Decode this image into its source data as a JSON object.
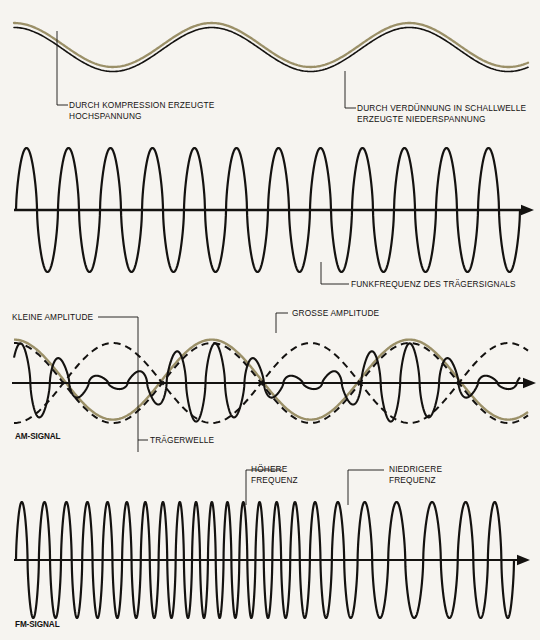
{
  "figure": {
    "background_color": "#f6f4f0",
    "ink_color": "#141210",
    "envelope_color": "#9b9068"
  },
  "panels": [
    {
      "id": "sound-wave",
      "labels": {
        "compression": "DURCH KOMPRESSION ERZEUGTE\nHOCHSPANNUNG",
        "rarefaction": "DURCH VERDÜNNUNG IN SCHALLWELLE\nERZEUGTE NIEDERSPANNUNG"
      }
    },
    {
      "id": "carrier-wave",
      "labels": {
        "carrier": "FUNKFREQUENZ DES TRÄGERSIGNALS"
      }
    },
    {
      "id": "am-signal",
      "labels": {
        "small_amplitude": "KLEINE AMPLITUDE",
        "large_amplitude": "GROSSE AMPLITUDE",
        "carrier_wave": "TRÄGERWELLE",
        "signal_name": "AM-SIGNAL"
      }
    },
    {
      "id": "fm-signal",
      "labels": {
        "higher_frequency": "HÖHERE\nFREQUENZ",
        "lower_frequency": "NIEDRIGERE\nFREQUENZ",
        "signal_name": "FM-SIGNAL"
      }
    }
  ],
  "chart_data": {
    "type": "line",
    "grid": false,
    "legend": "none",
    "xlabel": "",
    "ylabel": "",
    "series": [
      {
        "name": "Schallwelle (Modulationssignal)",
        "panel": "sound-wave",
        "waveform": "sine",
        "cycles": 2.6,
        "amplitude": 22,
        "baseline_y": 45,
        "x_start": 14,
        "x_end": 528,
        "phase_deg": 90,
        "double_line": true,
        "colors": [
          "#9b9068",
          "#141210"
        ]
      },
      {
        "name": "Trägerfrequenz",
        "panel": "carrier-wave",
        "waveform": "sine",
        "cycles": 12,
        "amplitude": 62,
        "baseline_y": 210,
        "x_start": 16,
        "x_end": 520,
        "axis_arrow": true
      },
      {
        "name": "AM-Signal Hüllkurve oben",
        "panel": "am-signal",
        "waveform": "sine",
        "cycles": 2.6,
        "amplitude": 40,
        "baseline_y": 383,
        "phase_deg": 90,
        "x_start": 14,
        "x_end": 528,
        "style": "solid-tan-over-dashed"
      },
      {
        "name": "AM-Signal Hüllkurve unten",
        "panel": "am-signal",
        "waveform": "sine",
        "cycles": 2.6,
        "amplitude": -40,
        "baseline_y": 383,
        "phase_deg": 90,
        "x_start": 14,
        "x_end": 528,
        "style": "dashed"
      },
      {
        "name": "AM-Signal moduliert",
        "panel": "am-signal",
        "waveform": "amplitude-modulated-carrier",
        "carrier_cycles": 13,
        "modulation_cycles": 2.6,
        "modulation_depth": 0.86,
        "peak_amplitude": 40,
        "baseline_y": 383,
        "x_start": 14,
        "x_end": 520,
        "axis_arrow": true
      },
      {
        "name": "FM-Signal",
        "panel": "fm-signal",
        "waveform": "frequency-modulated-carrier",
        "amplitude": 58,
        "baseline_y": 560,
        "x_start": 16,
        "x_end": 514,
        "total_cycles": 23,
        "frequency_profile": [
          1.0,
          1.05,
          1.12,
          1.2,
          1.3,
          1.42,
          1.5,
          1.45,
          1.3,
          1.1,
          0.88,
          0.72,
          0.64,
          0.68,
          0.8,
          0.95
        ],
        "axis_arrow": true
      }
    ],
    "annotations": [
      {
        "text": "DURCH KOMPRESSION ERZEUGTE HOCHSPANNUNG",
        "points_to": "wave-crest",
        "panel": "sound-wave"
      },
      {
        "text": "DURCH VERDÜNNUNG IN SCHALLWELLE ERZEUGTE NIEDERSPANNUNG",
        "points_to": "wave-trough",
        "panel": "sound-wave"
      },
      {
        "text": "FUNKFREQUENZ DES TRÄGERSIGNALS",
        "points_to": "carrier-trough",
        "panel": "carrier-wave"
      },
      {
        "text": "KLEINE AMPLITUDE",
        "points_to": "envelope-minimum",
        "panel": "am-signal"
      },
      {
        "text": "GROSSE AMPLITUDE",
        "points_to": "envelope-maximum",
        "panel": "am-signal"
      },
      {
        "text": "TRÄGERWELLE",
        "points_to": "carrier-within-am",
        "panel": "am-signal"
      },
      {
        "text": "HÖHERE FREQUENZ",
        "points_to": "compressed-cycles",
        "panel": "fm-signal"
      },
      {
        "text": "NIEDRIGERE FREQUENZ",
        "points_to": "expanded-cycles",
        "panel": "fm-signal"
      }
    ]
  }
}
